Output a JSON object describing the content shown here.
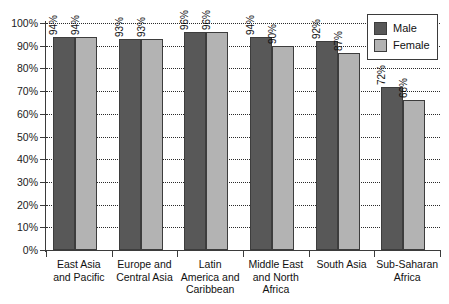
{
  "chart_data": {
    "type": "bar",
    "title": "",
    "xlabel": "",
    "ylabel": "",
    "ylim": [
      0,
      100
    ],
    "ytick_labels": [
      "100%",
      "90%",
      "80%",
      "70%",
      "60%",
      "50%",
      "40%",
      "30%",
      "20%",
      "10%",
      "0%"
    ],
    "ytick_values": [
      100,
      90,
      80,
      70,
      60,
      50,
      40,
      30,
      20,
      10,
      0
    ],
    "grid": true,
    "grid_style": "dotted-horizontal",
    "legend_position": "top-right",
    "value_label_suffix": "%",
    "value_label_rotation": 90,
    "categories": [
      "East Asia and Pacific",
      "Europe and Central Asia",
      "Latin America and Caribbean",
      "Middle East and North Africa",
      "South Asia",
      "Sub-Saharan Africa"
    ],
    "category_lines": [
      [
        "East Asia",
        "and Pacific"
      ],
      [
        "Europe and",
        "Central Asia"
      ],
      [
        "Latin",
        "America and",
        "Caribbean"
      ],
      [
        "Middle East",
        "and North",
        "Africa"
      ],
      [
        "South Asia"
      ],
      [
        "Sub-Saharan",
        "Africa"
      ]
    ],
    "series": [
      {
        "name": "Male",
        "color": "#585858",
        "values": [
          94,
          93,
          96,
          94,
          92,
          72
        ],
        "labels": [
          "94%",
          "93%",
          "96%",
          "94%",
          "92%",
          "72%"
        ]
      },
      {
        "name": "Female",
        "color": "#b3b3b3",
        "values": [
          94,
          93,
          96,
          90,
          87,
          66
        ],
        "labels": [
          "94%",
          "93%",
          "96%",
          "90%",
          "87%",
          "66%"
        ]
      }
    ]
  },
  "legend": {
    "items": [
      {
        "label": "Male",
        "color": "#585858"
      },
      {
        "label": "Female",
        "color": "#b3b3b3"
      }
    ]
  }
}
